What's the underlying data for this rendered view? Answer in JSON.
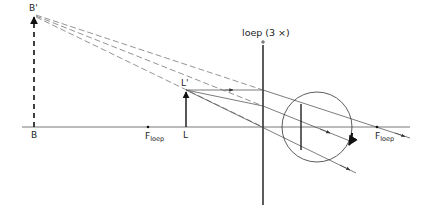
{
  "diagram": {
    "labels": {
      "image_top": "B'",
      "image_base": "B",
      "object_top": "L'",
      "object_base": "L",
      "focal_left_main": "F",
      "focal_left_sub": "loep",
      "focal_right_main": "F",
      "focal_right_sub": "loep",
      "lens": "loep (3 ×)"
    },
    "colors": {
      "line": "#333333",
      "thin": "#555555",
      "dashed": "#666666",
      "background": "#ffffff"
    },
    "geometry": {
      "axis_y": 127,
      "lens_x": 263,
      "object_x": 186,
      "object_top_y": 90,
      "image_x": 34,
      "image_top_y": 15,
      "focal_left_x": 148,
      "focal_right_x": 377,
      "eye_center": [
        317,
        127
      ],
      "eye_radius": 35
    }
  }
}
